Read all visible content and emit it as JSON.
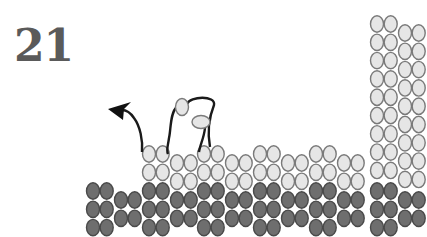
{
  "figure": {
    "number_label": "21"
  },
  "colors": {
    "light_atom_fill": "#e6e6e6",
    "light_atom_stroke": "#7a7a7a",
    "dark_atom_fill": "#6e6e6e",
    "dark_atom_stroke": "#4a4a4a",
    "wire": "#1a1a1a",
    "number": "#5a5a5a"
  },
  "atom_size": {
    "rx": 6.5,
    "ry": 8.2,
    "col_spacing": 13.7,
    "row_spacing": 18.3
  },
  "column_pairs": [
    {
      "x": 93,
      "light_top": null,
      "light_rows": 0,
      "dark_top": 191,
      "dark_rows": 3
    },
    {
      "x": 121,
      "light_top": null,
      "light_rows": 0,
      "dark_top": 200,
      "dark_rows": 2
    },
    {
      "x": 149,
      "light_top": 154,
      "light_rows": 2,
      "dark_top": 191,
      "dark_rows": 3
    },
    {
      "x": 177,
      "light_top": 163,
      "light_rows": 2,
      "dark_top": 200,
      "dark_rows": 2
    },
    {
      "x": 204,
      "light_top": 154,
      "light_rows": 2,
      "dark_top": 191,
      "dark_rows": 3
    },
    {
      "x": 232,
      "light_top": 163,
      "light_rows": 2,
      "dark_top": 200,
      "dark_rows": 2
    },
    {
      "x": 260,
      "light_top": 154,
      "light_rows": 2,
      "dark_top": 191,
      "dark_rows": 3
    },
    {
      "x": 288,
      "light_top": 163,
      "light_rows": 2,
      "dark_top": 200,
      "dark_rows": 2
    },
    {
      "x": 316,
      "light_top": 154,
      "light_rows": 2,
      "dark_top": 191,
      "dark_rows": 3
    },
    {
      "x": 344,
      "light_top": 163,
      "light_rows": 2,
      "dark_top": 200,
      "dark_rows": 2
    },
    {
      "x": 377,
      "light_top": 24,
      "light_rows": 9,
      "dark_top": 191,
      "dark_rows": 3
    },
    {
      "x": 405,
      "light_top": 33,
      "light_rows": 9,
      "dark_top": 200,
      "dark_rows": 2
    }
  ],
  "lifted_atoms": [
    {
      "cx": 182,
      "cy": 107,
      "rx": 6.5,
      "ry": 8.5
    },
    {
      "cx": 201,
      "cy": 122,
      "rx": 9,
      "ry": 6.5
    }
  ]
}
